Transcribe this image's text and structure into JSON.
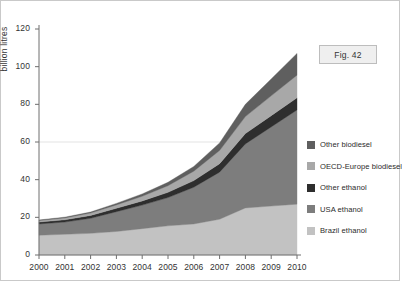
{
  "figure": {
    "fig_tag": "Fig. 42",
    "background": "#ffffff",
    "border_color": "#c9c9c9"
  },
  "legend": {
    "position": "right",
    "items": [
      {
        "label": "Other biodiesel",
        "color": "#5f5f5f",
        "key": "other_biodiesel"
      },
      {
        "label": "OECD-Europe biodiesel",
        "color": "#a8a8a8",
        "key": "oecd_europe_biodiesel"
      },
      {
        "label": "Other ethanol",
        "color": "#2e2e2e",
        "key": "other_ethanol"
      },
      {
        "label": "USA ethanol",
        "color": "#7d7d7d",
        "key": "usa_ethanol"
      },
      {
        "label": "Brazil ethanol",
        "color": "#c2c2c2",
        "key": "brazil_ethanol"
      }
    ]
  },
  "chart_data": {
    "type": "area",
    "stacked": true,
    "title": "",
    "xlabel": "",
    "ylabel": "billion litres",
    "x": [
      2000,
      2001,
      2002,
      2003,
      2004,
      2005,
      2006,
      2007,
      2008,
      2009,
      2010
    ],
    "xticklabels": [
      "2000",
      "2001",
      "2002",
      "2003",
      "2004",
      "2005",
      "2006",
      "2007",
      "2008",
      "2009",
      "2010"
    ],
    "yticks": [
      0,
      20,
      40,
      60,
      80,
      100,
      120
    ],
    "ylim": [
      0,
      120
    ],
    "xlim": [
      2000,
      2010
    ],
    "gridline_at": 60,
    "grid": false,
    "legend_position": "right",
    "series": [
      {
        "name": "Brazil ethanol",
        "color": "#c2c2c2",
        "values": [
          10.5,
          11.0,
          11.5,
          12.5,
          14.0,
          15.5,
          16.5,
          19.0,
          25.0,
          26.0,
          27.0
        ]
      },
      {
        "name": "USA ethanol",
        "color": "#7d7d7d",
        "values": [
          6.0,
          6.5,
          8.0,
          10.5,
          12.5,
          15.0,
          19.5,
          25.0,
          34.0,
          42.0,
          50.0
        ]
      },
      {
        "name": "Other ethanol",
        "color": "#2e2e2e",
        "values": [
          1.0,
          1.2,
          1.5,
          1.8,
          2.2,
          2.8,
          3.5,
          4.5,
          5.5,
          6.0,
          6.5
        ]
      },
      {
        "name": "OECD-Europe biodiesel",
        "color": "#a8a8a8",
        "values": [
          0.8,
          1.0,
          1.3,
          1.8,
          2.5,
          3.5,
          5.0,
          7.0,
          9.0,
          10.5,
          12.0
        ]
      },
      {
        "name": "Other biodiesel",
        "color": "#5f5f5f",
        "values": [
          0.3,
          0.4,
          0.5,
          0.8,
          1.2,
          1.8,
          2.5,
          4.0,
          6.5,
          9.0,
          11.5
        ]
      }
    ],
    "totals": [
      18.6,
      20.1,
      22.8,
      27.4,
      32.4,
      38.6,
      47.0,
      59.5,
      80.0,
      93.5,
      107.0
    ]
  }
}
